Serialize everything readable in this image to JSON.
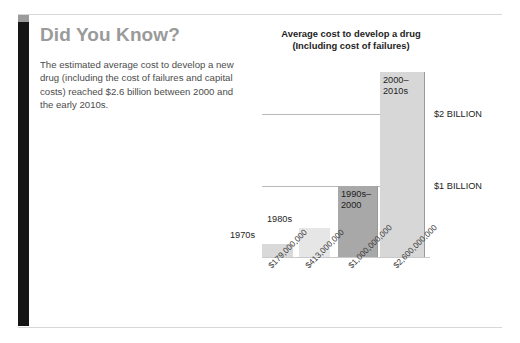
{
  "page": {
    "accent_dark": "#151515",
    "accent_cap": "#9b9b9b",
    "rule_color": "#d8d8d8"
  },
  "callout": {
    "heading": "Did You Know?",
    "body": "The estimated average cost to develop a new drug (including the cost of failures and capital costs) reached $2.6 billion between 2000 and the early 2010s."
  },
  "chart_data": {
    "type": "bar",
    "title": "Average cost to develop a drug\n(Including cost of failures)",
    "title_line1": "Average cost to develop a drug",
    "title_line2": "(Including cost of failures)",
    "xlabel": "",
    "ylabel": "",
    "ylim": [
      0,
      2600000000
    ],
    "grid": true,
    "legend": "none",
    "categories": [
      "1970s",
      "1980s",
      "1990s–\n2000",
      "2000–\n2010s"
    ],
    "category_labels": [
      "1970s",
      "1980s",
      "1990s–2000",
      "2000–2010s"
    ],
    "values": [
      179000000,
      413000000,
      1000000000,
      2600000000
    ],
    "tick_labels": [
      "$179,000,000",
      "$413,000,000",
      "$1,000,000,000",
      "$2,600,000,000"
    ],
    "bar_colors": [
      "#d9d9d9",
      "#e6e6e6",
      "#a8a8a8",
      "#d7d7d7"
    ],
    "gridlines": [
      {
        "label": "$2 BILLION",
        "value": 2000000000
      },
      {
        "label": "$1 BILLION",
        "value": 1000000000
      }
    ]
  }
}
